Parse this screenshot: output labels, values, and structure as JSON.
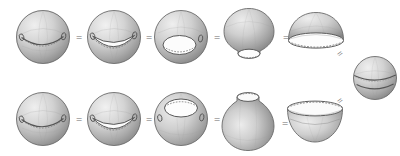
{
  "diagram": {
    "background_color": "#ffffff",
    "ink_color": "#5f5f5f",
    "shade_light": "#f0f0f0",
    "shade_mid": "#c8c8c8",
    "shade_dark": "#8d8d8d",
    "outline_color": "#6a6a6a",
    "relation_symbol": "=",
    "rows": [
      {
        "row_id": "top-row",
        "label": "top row",
        "steps": [
          {
            "id": "t1",
            "name": "sphere-with-slit",
            "caption": "sphere with curved slit and two endpoint circles"
          },
          {
            "id": "t2",
            "name": "sphere-with-open-slit",
            "caption": "slit opened into a lens shaped gap"
          },
          {
            "id": "t3",
            "name": "sphere-with-bottom-hole",
            "caption": "sphere with large round hole near bottom"
          },
          {
            "id": "t4",
            "name": "balloon-with-neck",
            "caption": "sphere stretched into balloon with narrow neck"
          },
          {
            "id": "t5",
            "name": "dome-open-downward",
            "caption": "hemispherical dome opening downward"
          },
          {
            "id": "t6",
            "name": "sphere-with-two-latitudes",
            "caption": "closed sphere with two latitude circles"
          }
        ],
        "relations": [
          "=",
          "=",
          "=",
          "=",
          "="
        ]
      },
      {
        "row_id": "bottom-row",
        "label": "bottom row",
        "steps": [
          {
            "id": "b1",
            "name": "sphere-with-slit",
            "caption": "sphere with curved slit and two endpoint circles"
          },
          {
            "id": "b2",
            "name": "sphere-with-open-slit",
            "caption": "slit opened into a lens shaped gap"
          },
          {
            "id": "b3",
            "name": "sphere-with-top-hole",
            "caption": "sphere with large round hole near top"
          },
          {
            "id": "b4",
            "name": "vase-with-neck",
            "caption": "sphere pinched into vase with upward neck"
          },
          {
            "id": "b5",
            "name": "bowl-open-upward",
            "caption": "hemispherical bowl opening upward"
          },
          {
            "id": "b6",
            "name": "sphere-with-two-latitudes",
            "caption": "closed sphere with two latitude circles"
          }
        ],
        "relations": [
          "=",
          "=",
          "=",
          "=",
          "="
        ]
      }
    ],
    "shared_result": {
      "name": "sphere-with-two-latitudes",
      "caption": "closed sphere with two latitude circles"
    }
  }
}
